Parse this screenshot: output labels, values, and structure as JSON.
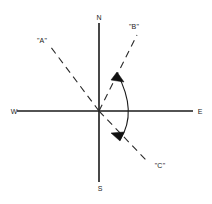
{
  "figure": {
    "background_color": "#ffffff",
    "ink_color": "#1a1a1a",
    "origin": {
      "x": 99,
      "y": 111
    },
    "cardinals": [
      {
        "id": "north",
        "label": "N",
        "x": 99,
        "y": 20,
        "anchor": "middle"
      },
      {
        "id": "south",
        "label": "S",
        "x": 100,
        "y": 191,
        "anchor": "middle"
      },
      {
        "id": "west",
        "label": "W",
        "x": 14,
        "y": 114,
        "anchor": "middle"
      },
      {
        "id": "east",
        "label": "E",
        "x": 200,
        "y": 114,
        "anchor": "middle"
      }
    ],
    "axes": [
      {
        "id": "vertical-axis",
        "x1": 99,
        "y1": 23,
        "x2": 99,
        "y2": 182
      },
      {
        "id": "horizontal-axis",
        "x1": 17,
        "y1": 111,
        "x2": 193,
        "y2": 111
      }
    ],
    "rays": [
      {
        "id": "ray-a",
        "label": "\"A\"",
        "x1": 99,
        "y1": 111,
        "x2": 50,
        "y2": 46,
        "dash": "7 5",
        "label_x": 42,
        "label_y": 43,
        "label_anchor": "middle"
      },
      {
        "id": "ray-b",
        "label": "\"B\"",
        "x1": 99,
        "y1": 111,
        "x2": 137,
        "y2": 35,
        "dash": "7 5",
        "label_x": 134,
        "label_y": 29,
        "label_anchor": "middle"
      },
      {
        "id": "ray-c",
        "label": "\"C\"",
        "x1": 99,
        "y1": 111,
        "x2": 146,
        "y2": 160,
        "dash": "7 5",
        "label_x": 160,
        "label_y": 168,
        "label_anchor": "middle"
      }
    ],
    "angle_arc": {
      "id": "angle-arc-b-to-c",
      "path": "M 117 73 Q 138 112 120 140",
      "arrow_top": "M 117 73 L 123 81 L 112 80 Z",
      "arrow_bottom": "M 120 140 L 112 134 L 123 133 Z"
    }
  }
}
